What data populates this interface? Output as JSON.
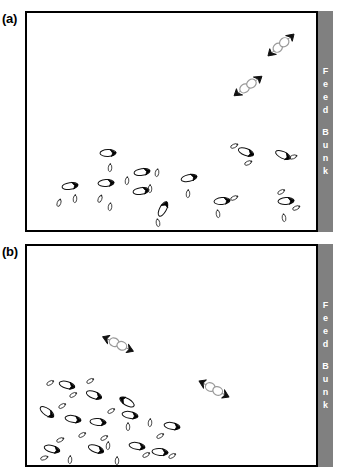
{
  "figure": {
    "title_absent": true,
    "background_color": "#ffffff",
    "outline_color": "#000000",
    "feed_bunk_color": "#808080",
    "feed_bunk_text_color": "#ffffff"
  },
  "feed_bunk": {
    "name": "Feed Bunk",
    "letters_top": [
      "F",
      "e",
      "e",
      "d"
    ],
    "letters_bottom": [
      "B",
      "u",
      "n",
      "k"
    ]
  },
  "panels": [
    {
      "id": "a",
      "label": "(a)",
      "feed_bunk_label": "Feed Bunk",
      "description": "Cattle distribution diagram, panel a",
      "animals": [
        {
          "type": "pair",
          "x": 281,
          "y": 45,
          "angle": -40
        },
        {
          "type": "pair",
          "x": 248,
          "y": 86,
          "angle": -35
        },
        {
          "type": "cow",
          "x": 108,
          "y": 153,
          "angle": 178
        },
        {
          "type": "calf",
          "x": 110,
          "y": 168,
          "angle": 95
        },
        {
          "type": "cow",
          "x": 142,
          "y": 172,
          "angle": 172
        },
        {
          "type": "calf",
          "x": 157,
          "y": 173,
          "angle": 100
        },
        {
          "type": "cow",
          "x": 70,
          "y": 186,
          "angle": 172
        },
        {
          "type": "cow",
          "x": 106,
          "y": 183,
          "angle": 176
        },
        {
          "type": "cow",
          "x": 141,
          "y": 191,
          "angle": 172
        },
        {
          "type": "calf",
          "x": 150,
          "y": 189,
          "angle": 92
        },
        {
          "type": "cow",
          "x": 189,
          "y": 178,
          "angle": 168
        },
        {
          "type": "calf",
          "x": 188,
          "y": 194,
          "angle": 94
        },
        {
          "type": "cow",
          "x": 163,
          "y": 209,
          "angle": 118
        },
        {
          "type": "calf",
          "x": 158,
          "y": 223,
          "angle": 80
        },
        {
          "type": "calf",
          "x": 59,
          "y": 203,
          "angle": 110
        },
        {
          "type": "calf",
          "x": 75,
          "y": 199,
          "angle": 95
        },
        {
          "type": "calf",
          "x": 100,
          "y": 199,
          "angle": 112
        },
        {
          "type": "calf",
          "x": 110,
          "y": 207,
          "angle": 98
        },
        {
          "type": "calf",
          "x": 127,
          "y": 181,
          "angle": 96
        },
        {
          "type": "cow",
          "x": 246,
          "y": 152,
          "angle": 200
        },
        {
          "type": "calf",
          "x": 234,
          "y": 146,
          "angle": 155
        },
        {
          "type": "calf",
          "x": 248,
          "y": 163,
          "angle": 155
        },
        {
          "type": "cow",
          "x": 283,
          "y": 155,
          "angle": 205
        },
        {
          "type": "calf",
          "x": 293,
          "y": 157,
          "angle": 160
        },
        {
          "type": "cow",
          "x": 222,
          "y": 201,
          "angle": 175
        },
        {
          "type": "calf",
          "x": 234,
          "y": 198,
          "angle": 155
        },
        {
          "type": "calf",
          "x": 218,
          "y": 214,
          "angle": 82
        },
        {
          "type": "cow",
          "x": 286,
          "y": 201,
          "angle": 176
        },
        {
          "type": "calf",
          "x": 281,
          "y": 192,
          "angle": 150
        },
        {
          "type": "calf",
          "x": 296,
          "y": 208,
          "angle": 155
        },
        {
          "type": "calf",
          "x": 284,
          "y": 218,
          "angle": 82
        }
      ]
    },
    {
      "id": "b",
      "label": "(b)",
      "feed_bunk_label": "Feed Bunk",
      "description": "Cattle distribution diagram, panel b",
      "animals": [
        {
          "type": "pair",
          "x": 118,
          "y": 344,
          "angle": 25
        },
        {
          "type": "pair",
          "x": 214,
          "y": 389,
          "angle": 28
        },
        {
          "type": "cow",
          "x": 67,
          "y": 385,
          "angle": 195
        },
        {
          "type": "calf",
          "x": 50,
          "y": 383,
          "angle": 150
        },
        {
          "type": "calf",
          "x": 73,
          "y": 395,
          "angle": 150
        },
        {
          "type": "calf",
          "x": 90,
          "y": 381,
          "angle": 150
        },
        {
          "type": "cow",
          "x": 94,
          "y": 395,
          "angle": 200
        },
        {
          "type": "cow",
          "x": 47,
          "y": 412,
          "angle": 215
        },
        {
          "type": "calf",
          "x": 62,
          "y": 406,
          "angle": 150
        },
        {
          "type": "cow",
          "x": 73,
          "y": 419,
          "angle": 190
        },
        {
          "type": "cow",
          "x": 98,
          "y": 422,
          "angle": 185
        },
        {
          "type": "calf",
          "x": 111,
          "y": 411,
          "angle": 150
        },
        {
          "type": "cow",
          "x": 130,
          "y": 415,
          "angle": 190
        },
        {
          "type": "cow",
          "x": 127,
          "y": 402,
          "angle": 30
        },
        {
          "type": "calf",
          "x": 128,
          "y": 427,
          "angle": 90
        },
        {
          "type": "calf",
          "x": 82,
          "y": 435,
          "angle": 150
        },
        {
          "type": "calf",
          "x": 104,
          "y": 438,
          "angle": 150
        },
        {
          "type": "calf",
          "x": 60,
          "y": 440,
          "angle": 155
        },
        {
          "type": "cow",
          "x": 52,
          "y": 449,
          "angle": 195
        },
        {
          "type": "calf",
          "x": 44,
          "y": 458,
          "angle": 160
        },
        {
          "type": "calf",
          "x": 70,
          "y": 460,
          "angle": 95
        },
        {
          "type": "cow",
          "x": 96,
          "y": 449,
          "angle": 200
        },
        {
          "type": "calf",
          "x": 108,
          "y": 446,
          "angle": 95
        },
        {
          "type": "calf",
          "x": 117,
          "y": 461,
          "angle": 92
        },
        {
          "type": "cow",
          "x": 137,
          "y": 446,
          "angle": 190
        },
        {
          "type": "calf",
          "x": 146,
          "y": 455,
          "angle": 150
        },
        {
          "type": "cow",
          "x": 160,
          "y": 452,
          "angle": 185
        },
        {
          "type": "calf",
          "x": 172,
          "y": 456,
          "angle": 150
        },
        {
          "type": "cow",
          "x": 172,
          "y": 426,
          "angle": 190
        },
        {
          "type": "calf",
          "x": 160,
          "y": 436,
          "angle": 150
        },
        {
          "type": "calf",
          "x": 150,
          "y": 423,
          "angle": 95
        }
      ]
    }
  ]
}
